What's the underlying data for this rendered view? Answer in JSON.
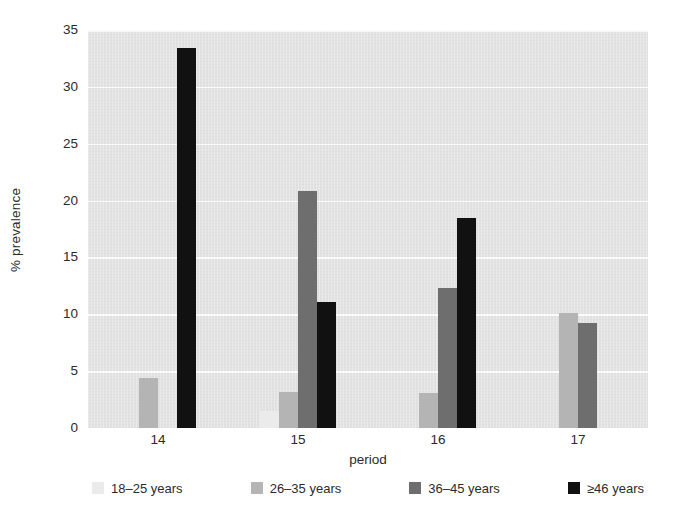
{
  "chart_data": {
    "type": "bar",
    "title": "",
    "subtitle": "",
    "xlabel": "period",
    "ylabel": "% prevalence",
    "categories": [
      "14",
      "15",
      "16",
      "17"
    ],
    "series": [
      {
        "name": "18–25 years",
        "color": "#ebebeb",
        "values": [
          0,
          1.5,
          0,
          0
        ]
      },
      {
        "name": "26–35 years",
        "color": "#b4b4b4",
        "values": [
          4.4,
          3.2,
          3.1,
          10.1
        ]
      },
      {
        "name": "36–45 years",
        "color": "#6e6e6e",
        "values": [
          0,
          20.8,
          12.3,
          9.2
        ]
      },
      {
        "name": "≥46 years",
        "color": "#111111",
        "values": [
          33.4,
          11.1,
          18.5,
          0
        ]
      }
    ],
    "ylim": [
      0,
      35
    ],
    "yticks": [
      0,
      5,
      10,
      15,
      20,
      25,
      30,
      35
    ],
    "ytick_labels": [
      "0",
      "5",
      "10",
      "15",
      "20",
      "25",
      "30",
      "35"
    ],
    "grid": true,
    "grid_axis": "y",
    "legend_position": "bottom",
    "plot_background": "#e2e2e2",
    "gridline_color": "#fbfbfb",
    "bar_group_order": [
      "18–25 years",
      "26–35 years",
      "36–45 years",
      "≥46 years"
    ]
  }
}
